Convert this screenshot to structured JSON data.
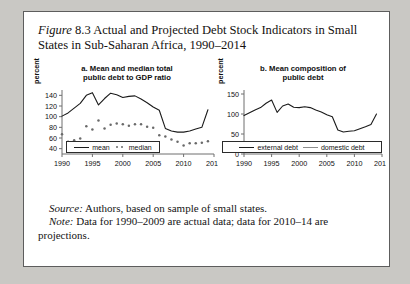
{
  "figure": {
    "label": "Figure",
    "number": "8.3",
    "title": "Actual and Projected Debt Stock Indicators in Small States in Sub-Saharan Africa, 1990–2014"
  },
  "notes": {
    "source_lead": "Source:",
    "source_text": "Authors, based on sample of small states.",
    "note_lead": "Note:",
    "note_text": "Data for 1990–2009 are actual data; data for 2010–14 are projections."
  },
  "panel_a": {
    "subtitle_line1": "a. Mean and median total",
    "subtitle_line2": "public debt to GDP ratio",
    "ylabel": "percent",
    "legend": [
      {
        "label": "mean",
        "style": "line",
        "color": "#1a1a1a"
      },
      {
        "label": "median",
        "style": "dots",
        "color": "#6a6a6a"
      }
    ]
  },
  "panel_b": {
    "subtitle_line1": "b. Mean composition of",
    "subtitle_line2": "public debt",
    "ylabel": "percent",
    "legend": [
      {
        "label": "external debt",
        "style": "line",
        "color": "#1a1a1a"
      },
      {
        "label": "domestic debt",
        "style": "line",
        "color": "#8d8d8d"
      }
    ]
  },
  "chart_data": [
    {
      "type": "line",
      "id": "panel-a",
      "title": "a. Mean and median total public debt to GDP ratio",
      "xlabel": "",
      "ylabel": "percent",
      "xlim": [
        1990,
        2015
      ],
      "ylim": [
        30,
        150
      ],
      "yticks": [
        40,
        60,
        80,
        100,
        120,
        140
      ],
      "xticks": [
        1990,
        1995,
        2000,
        2005,
        2010,
        2015
      ],
      "grid": false,
      "legend_position": "below",
      "x": [
        1990,
        1991,
        1992,
        1993,
        1994,
        1995,
        1996,
        1997,
        1998,
        1999,
        2000,
        2001,
        2002,
        2003,
        2004,
        2005,
        2006,
        2007,
        2008,
        2009,
        2010,
        2011,
        2012,
        2013,
        2014
      ],
      "series": [
        {
          "name": "mean",
          "style": "line",
          "values": [
            101,
            107,
            116,
            125,
            140,
            145,
            122,
            134,
            144,
            141,
            136,
            138,
            139,
            133,
            126,
            118,
            112,
            78,
            73,
            71,
            71,
            73,
            77,
            80,
            113
          ]
        },
        {
          "name": "median",
          "style": "dots",
          "values": [
            67,
            53,
            56,
            59,
            82,
            76,
            93,
            78,
            85,
            87,
            86,
            83,
            86,
            86,
            81,
            79,
            65,
            63,
            57,
            53,
            46,
            50,
            50,
            51,
            54
          ]
        }
      ]
    },
    {
      "type": "line",
      "id": "panel-b",
      "title": "b. Mean composition of public debt",
      "xlabel": "",
      "ylabel": "percent",
      "xlim": [
        1990,
        2015
      ],
      "ylim": [
        0,
        160
      ],
      "yticks": [
        0,
        50,
        100,
        150
      ],
      "xticks": [
        1990,
        1995,
        2000,
        2005,
        2010,
        2015
      ],
      "grid": false,
      "legend_position": "below",
      "x": [
        1990,
        1991,
        1992,
        1993,
        1994,
        1995,
        1996,
        1997,
        1998,
        1999,
        2000,
        2001,
        2002,
        2003,
        2004,
        2005,
        2006,
        2007,
        2008,
        2009,
        2010,
        2011,
        2012,
        2013,
        2014
      ],
      "series": [
        {
          "name": "external debt",
          "style": "line",
          "values": [
            96,
            103,
            110,
            116,
            127,
            135,
            104,
            120,
            125,
            117,
            116,
            118,
            116,
            110,
            105,
            98,
            93,
            60,
            55,
            57,
            58,
            63,
            68,
            74,
            100
          ]
        },
        {
          "name": "domestic debt",
          "style": "line",
          "values": [
            8,
            9,
            10,
            12,
            14,
            15,
            27,
            24,
            25,
            24,
            25,
            25,
            25,
            25,
            25,
            25,
            25,
            24,
            23,
            22,
            21,
            20,
            19,
            14,
            15
          ]
        }
      ]
    }
  ]
}
